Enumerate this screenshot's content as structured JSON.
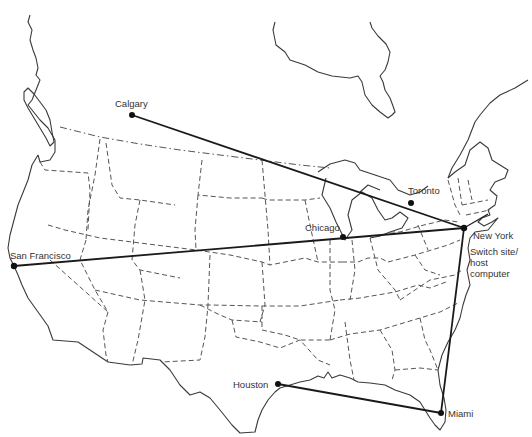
{
  "map": {
    "title": "",
    "colors": {
      "background": "#ffffff",
      "link": "#1a1a1a",
      "coast": "#3a3a3a",
      "state_border": "#555555"
    },
    "cities": [
      {
        "id": "calgary",
        "label": "Calgary",
        "x": 132,
        "y": 115
      },
      {
        "id": "toronto",
        "label": "Toronto",
        "x": 411,
        "y": 203
      },
      {
        "id": "new-york",
        "label": "New York",
        "x": 464,
        "y": 228
      },
      {
        "id": "chicago",
        "label": "Chicago",
        "x": 343,
        "y": 237
      },
      {
        "id": "san-francisco",
        "label": "San Francisco",
        "x": 14,
        "y": 266
      },
      {
        "id": "houston",
        "label": "Houston",
        "x": 278,
        "y": 384
      },
      {
        "id": "miami",
        "label": "Miami",
        "x": 441,
        "y": 413
      }
    ],
    "hub_note": {
      "line1": "Switch site/",
      "line2": "host",
      "line3": "computer"
    },
    "links": [
      {
        "from": "Calgary",
        "to": "New York"
      },
      {
        "from": "San Francisco",
        "to": "New York"
      },
      {
        "from": "New York",
        "to": "Miami"
      },
      {
        "from": "Houston",
        "to": "Miami"
      }
    ]
  }
}
